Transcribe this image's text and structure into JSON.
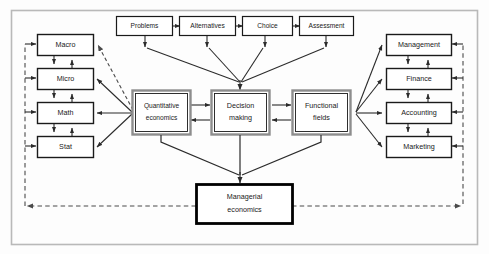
{
  "diagram": {
    "frame": {
      "stroke": "#b9b9b9"
    },
    "colors": {
      "box_stroke": "#1a1a1a",
      "double_box_outer": "#8d8d8d",
      "double_box_inner": "#1a1a1a",
      "emphasis_stroke": "#000000",
      "arrow": "#2b2b2b",
      "dashed": "#4a4a4a",
      "box_fill": "#ffffff",
      "background": "#fdfdfd"
    },
    "process_row": {
      "name": "decision-process-row",
      "boxes": [
        {
          "id": "problems",
          "label": "Problems"
        },
        {
          "id": "alternatives",
          "label": "Alternatives"
        },
        {
          "id": "choice",
          "label": "Choice"
        },
        {
          "id": "assessment",
          "label": "Assessment"
        }
      ]
    },
    "left_column": {
      "name": "quantitative-disciplines-column",
      "boxes": [
        {
          "id": "macro",
          "label": "Macro"
        },
        {
          "id": "micro",
          "label": "Micro"
        },
        {
          "id": "math",
          "label": "Math"
        },
        {
          "id": "stat",
          "label": "Stat"
        }
      ]
    },
    "right_column": {
      "name": "functional-fields-column",
      "boxes": [
        {
          "id": "management",
          "label": "Management"
        },
        {
          "id": "finance",
          "label": "Finance"
        },
        {
          "id": "accounting",
          "label": "Accounting"
        },
        {
          "id": "marketing",
          "label": "Marketing"
        }
      ]
    },
    "center_row": {
      "name": "core-concepts-row",
      "boxes": [
        {
          "id": "quantitative-economics",
          "line1": "Quantitative",
          "line2": "economics"
        },
        {
          "id": "decision-making",
          "line1": "Decision",
          "line2": "making"
        },
        {
          "id": "functional-fields",
          "line1": "Functional",
          "line2": "fields"
        }
      ]
    },
    "result_box": {
      "id": "managerial-economics",
      "line1": "Managerial",
      "line2": "economics"
    }
  }
}
